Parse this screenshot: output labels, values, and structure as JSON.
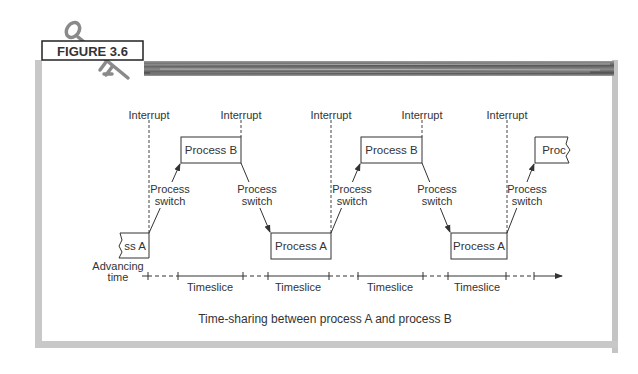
{
  "figure": {
    "label": "FIGURE 3.6",
    "caption": "Time-sharing between process A and process B"
  },
  "diagram": {
    "interrupt_label": "Interrupt",
    "switch_label_line1": "Process",
    "switch_label_line2": "switch",
    "axis_label_line1": "Advancing",
    "axis_label_line2": "time",
    "timeslice_label": "Timeslice",
    "interrupts": [
      {
        "label": "Interrupt"
      },
      {
        "label": "Interrupt"
      },
      {
        "label": "Interrupt"
      },
      {
        "label": "Interrupt"
      },
      {
        "label": "Interrupt"
      }
    ],
    "process_boxes": [
      {
        "label": "ss A",
        "full": "Process A",
        "partial": true
      },
      {
        "label": "Process B",
        "partial": false
      },
      {
        "label": "Process A",
        "partial": false
      },
      {
        "label": "Process B",
        "partial": false
      },
      {
        "label": "Process A",
        "partial": false
      },
      {
        "label": "Proc",
        "full": "Process B",
        "partial": true
      }
    ],
    "timeslices": [
      {
        "label": "Timeslice"
      },
      {
        "label": "Timeslice"
      },
      {
        "label": "Timeslice"
      },
      {
        "label": "Timeslice"
      }
    ]
  },
  "colors": {
    "line": "#333333",
    "frame": "#c8c8c8",
    "stripe": "#6e6e6e",
    "text": "#333333"
  }
}
